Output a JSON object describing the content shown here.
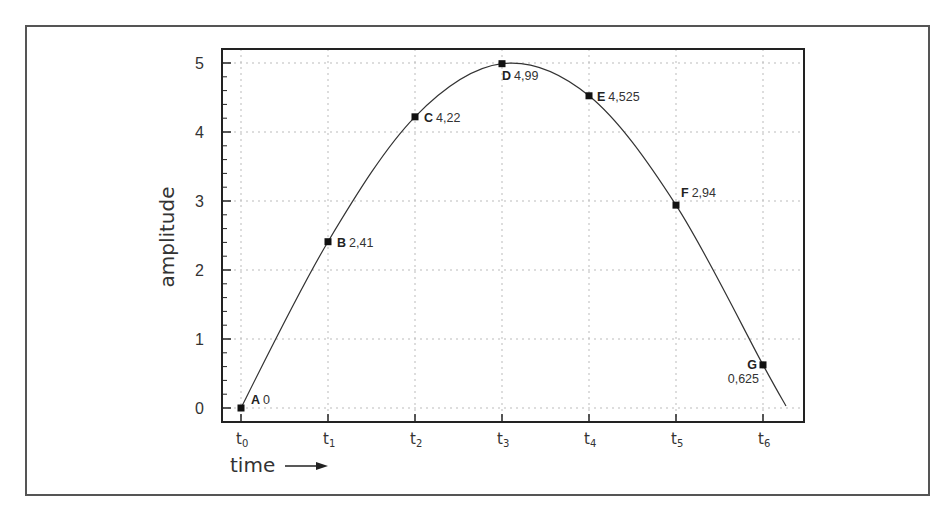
{
  "chart_data": {
    "type": "line",
    "title": "",
    "xlabel": "time",
    "ylabel": "amplitude",
    "x_tick_labels": [
      {
        "base": "t",
        "sub": "0"
      },
      {
        "base": "t",
        "sub": "1"
      },
      {
        "base": "t",
        "sub": "2"
      },
      {
        "base": "t",
        "sub": "3"
      },
      {
        "base": "t",
        "sub": "4"
      },
      {
        "base": "t",
        "sub": "5"
      },
      {
        "base": "t",
        "sub": "6"
      }
    ],
    "y_ticks": [
      0,
      1,
      2,
      3,
      4,
      5
    ],
    "ylim": [
      -0.2,
      5.2
    ],
    "grid": true,
    "legend": null,
    "points": [
      {
        "label": "A",
        "x": "t0",
        "y": 0,
        "value_text": "0"
      },
      {
        "label": "B",
        "x": "t1",
        "y": 2.41,
        "value_text": "2,41"
      },
      {
        "label": "C",
        "x": "t2",
        "y": 4.22,
        "value_text": "4,22"
      },
      {
        "label": "D",
        "x": "t3",
        "y": 4.99,
        "value_text": "4,99"
      },
      {
        "label": "E",
        "x": "t4",
        "y": 4.525,
        "value_text": "4,525"
      },
      {
        "label": "F",
        "x": "t5",
        "y": 2.94,
        "value_text": "2,94"
      },
      {
        "label": "G",
        "x": "t6",
        "y": 0.625,
        "value_text": "0,625"
      }
    ],
    "series": [
      {
        "name": "amplitude",
        "x": [
          0,
          1,
          2,
          3,
          4,
          5,
          6
        ],
        "values": [
          0,
          2.41,
          4.22,
          4.99,
          4.525,
          2.94,
          0.625
        ]
      }
    ],
    "annotations": [
      "time arrow pointing right"
    ]
  }
}
